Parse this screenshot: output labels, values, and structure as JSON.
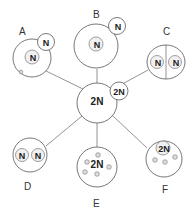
{
  "diagram": {
    "center": {
      "label": "2N",
      "bud_label": "2N"
    },
    "nodes": [
      {
        "id": "A",
        "label": "A",
        "nucleus": "N",
        "bud": "N"
      },
      {
        "id": "B",
        "label": "B",
        "nucleus": "N",
        "bud": "N"
      },
      {
        "id": "C",
        "label": "C",
        "nuclei": [
          "N",
          "N"
        ]
      },
      {
        "id": "D",
        "label": "D",
        "nuclei": [
          "N",
          "N"
        ]
      },
      {
        "id": "E",
        "label": "E",
        "nucleus": "2N"
      },
      {
        "id": "F",
        "label": "F",
        "nucleus": "2N"
      }
    ]
  }
}
